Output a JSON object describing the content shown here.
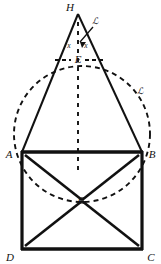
{
  "figure": {
    "background_color": "#ffffff",
    "ink_color": "#111111",
    "width": 161,
    "height": 264
  },
  "points": {
    "A": {
      "label": "A",
      "x": 22,
      "y": 152,
      "label_x": 8,
      "label_y": 157
    },
    "B": {
      "label": "B",
      "x": 142,
      "y": 152,
      "label_x": 147,
      "label_y": 157
    },
    "C": {
      "label": "C",
      "x": 142,
      "y": 249,
      "label_x": 147,
      "label_y": 259
    },
    "D": {
      "label": "D",
      "x": 22,
      "y": 249,
      "label_x": 8,
      "label_y": 259
    },
    "E": {
      "label": "E",
      "x": 78,
      "y": 60,
      "label_x": 74,
      "label_y": 63
    },
    "G": {
      "label": "G",
      "x": 82,
      "y": 200,
      "label_x": 78,
      "label_y": 204
    },
    "H": {
      "label": "H",
      "x": 78,
      "y": 14,
      "label_x": 70,
      "label_y": 10
    }
  },
  "angle_marks": [
    {
      "label": "x",
      "x": 68,
      "y": 45
    },
    {
      "label": "x",
      "x": 85,
      "y": 45
    }
  ],
  "script_labels": [
    {
      "name": "apex-script-label",
      "text": "ℒ",
      "x": 95,
      "y": 22
    },
    {
      "name": "arc-script-label",
      "text": "ℒ",
      "x": 140,
      "y": 92
    }
  ],
  "solid_segments": [
    {
      "name": "side-AH",
      "from": "A",
      "to": "H"
    },
    {
      "name": "side-BH",
      "from": "B",
      "to": "H"
    },
    {
      "name": "side-AB",
      "from": "A",
      "to": "B"
    },
    {
      "name": "side-BC",
      "from": "B",
      "to": "C"
    },
    {
      "name": "side-CD",
      "from": "C",
      "to": "D"
    },
    {
      "name": "side-DA",
      "from": "D",
      "to": "A"
    },
    {
      "name": "diagonal-AG",
      "from": "A",
      "to": "G"
    },
    {
      "name": "diagonal-BG",
      "from": "B",
      "to": "G"
    },
    {
      "name": "diagonal-CG",
      "from": "C",
      "to": "G"
    },
    {
      "name": "diagonal-DG",
      "from": "D",
      "to": "G"
    }
  ],
  "dashed_elements": [
    {
      "name": "altitude-HE-G",
      "type": "vertical-line",
      "x": 78,
      "y_top": 22,
      "y_bottom": 175
    },
    {
      "name": "chord-through-E",
      "type": "horizontal-line",
      "y": 60,
      "x_left": 55,
      "x_right": 103
    },
    {
      "name": "circumscribed-circle",
      "type": "circle",
      "cx": 82,
      "cy": 134,
      "r": 68
    }
  ],
  "stroke_widths": {
    "rectangle": 3.2,
    "triangle": 2.0,
    "diagonal": 2.4,
    "dashed": 1.9
  },
  "dash_patterns": {
    "circle": "5 4",
    "altitude": "4 5",
    "chord": "4 3"
  }
}
